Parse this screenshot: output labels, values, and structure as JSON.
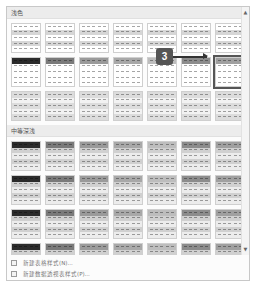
{
  "sections": [
    {
      "title": "浅色",
      "rows": [
        [
          "l-banded-0",
          "l-banded-1",
          "l-banded-2",
          "l-banded-3",
          "l-banded-4",
          "l-banded-5",
          "l-banded-6"
        ],
        [
          "l-header-0",
          "l-header-1",
          "l-header-2",
          "l-header-3",
          "l-header-4",
          "l-header-5",
          "l-header-6"
        ],
        [
          "l-grid-0",
          "l-grid-1",
          "l-grid-2",
          "l-grid-3",
          "l-grid-4",
          "l-grid-5",
          "l-grid-6"
        ]
      ]
    },
    {
      "title": "中等深浅",
      "rows": [
        [
          "m-a-0",
          "m-a-1",
          "m-a-2",
          "m-a-3",
          "m-a-4",
          "m-a-5",
          "m-a-6"
        ],
        [
          "m-b-0",
          "m-b-1",
          "m-b-2",
          "m-b-3",
          "m-b-4",
          "m-b-5",
          "m-b-6"
        ],
        [
          "m-c-0",
          "m-c-1",
          "m-c-2",
          "m-c-3",
          "m-c-4",
          "m-c-5",
          "m-c-6"
        ],
        [
          "m-d-0",
          "m-d-1",
          "m-d-2",
          "m-d-3",
          "m-d-4",
          "m-d-5",
          "m-d-6"
        ]
      ]
    },
    {
      "title": "深色",
      "rows": [
        [
          "d-0",
          "d-1",
          "d-2",
          "d-3",
          "d-4",
          "d-5",
          "d-6"
        ]
      ]
    }
  ],
  "selected": {
    "section": 0,
    "row": 1,
    "col": 6
  },
  "callout": {
    "label": "3"
  },
  "menu": [
    {
      "label": "新建表格样式(N)...",
      "icon": "table-style-icon"
    },
    {
      "label": "新建数据透视表样式(P)...",
      "icon": "pivot-style-icon"
    }
  ],
  "scroll": {
    "up": "▲",
    "down": "▼"
  },
  "colors": {
    "shades": [
      "#2b2b2b",
      "#7a7a7a",
      "#9a9a9a",
      "#a8a8a8",
      "#bdbdbd",
      "#8c8c8c",
      "#a0a0a0"
    ],
    "select_border": "#555555"
  }
}
